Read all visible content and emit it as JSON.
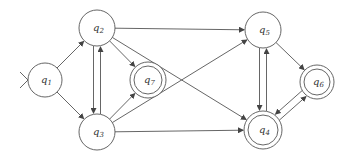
{
  "diagram": {
    "type": "finite-automaton",
    "colors": {
      "stroke": "#555555",
      "background": "#ffffff",
      "text": "#333333"
    },
    "start_state": "q1",
    "nodes": [
      {
        "id": "q1",
        "label": "q",
        "sub": "1",
        "x": 45,
        "y": 80,
        "r": 17,
        "accepting": false
      },
      {
        "id": "q2",
        "label": "q",
        "sub": "2",
        "x": 97,
        "y": 28,
        "r": 18,
        "accepting": false
      },
      {
        "id": "q3",
        "label": "q",
        "sub": "3",
        "x": 97,
        "y": 132,
        "r": 18,
        "accepting": false
      },
      {
        "id": "q7",
        "label": "q",
        "sub": "7",
        "x": 148,
        "y": 80,
        "r": 18,
        "accepting": true
      },
      {
        "id": "q5",
        "label": "q",
        "sub": "5",
        "x": 263,
        "y": 30,
        "r": 18,
        "accepting": false
      },
      {
        "id": "q4",
        "label": "q",
        "sub": "4",
        "x": 263,
        "y": 130,
        "r": 19,
        "accepting": true
      },
      {
        "id": "q6",
        "label": "q",
        "sub": "6",
        "x": 317,
        "y": 82,
        "r": 17,
        "accepting": true
      }
    ],
    "edges": [
      {
        "from": "q1",
        "to": "q2"
      },
      {
        "from": "q1",
        "to": "q3"
      },
      {
        "from": "q2",
        "to": "q3"
      },
      {
        "from": "q3",
        "to": "q2"
      },
      {
        "from": "q2",
        "to": "q7"
      },
      {
        "from": "q3",
        "to": "q7"
      },
      {
        "from": "q2",
        "to": "q5"
      },
      {
        "from": "q2",
        "to": "q4"
      },
      {
        "from": "q3",
        "to": "q5"
      },
      {
        "from": "q3",
        "to": "q4"
      },
      {
        "from": "q5",
        "to": "q4"
      },
      {
        "from": "q4",
        "to": "q5"
      },
      {
        "from": "q5",
        "to": "q6"
      },
      {
        "from": "q6",
        "to": "q4"
      },
      {
        "from": "q4",
        "to": "q6"
      }
    ]
  }
}
